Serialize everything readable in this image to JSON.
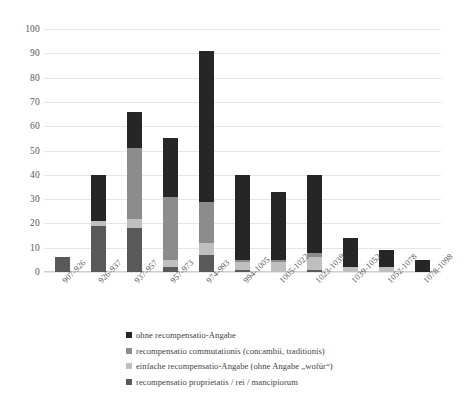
{
  "chart_data": {
    "type": "bar",
    "subtype": "stacked-column",
    "title": "",
    "xlabel": "",
    "ylabel": "",
    "ylim": [
      0,
      100
    ],
    "yticks": [
      0,
      10,
      20,
      30,
      40,
      50,
      60,
      70,
      80,
      90,
      100
    ],
    "grid": true,
    "legend_position": "bottom",
    "categories": [
      "907-926",
      "926-937",
      "937-957",
      "957-973",
      "974-993",
      "994-1005",
      "1005-1022",
      "1023-1039",
      "1039-1052",
      "1052-1078",
      "1078-1098"
    ],
    "series": [
      {
        "name": "recompensatio proprietatis / rei / mancipiorum",
        "color": "#595959",
        "values": [
          6,
          19,
          18,
          2,
          7,
          1,
          0,
          1,
          0,
          0,
          0
        ]
      },
      {
        "name": "einfache recompensatio-Angabe (ohne Angabe „wofür“)",
        "color": "#bfbfbf",
        "values": [
          0,
          2,
          4,
          3,
          5,
          3,
          4,
          5,
          2,
          2,
          0
        ]
      },
      {
        "name": "recompensatio commutationis (concambii, traditionis)",
        "color": "#8c8c8c",
        "values": [
          0,
          0,
          29,
          26,
          17,
          1,
          1,
          2,
          0,
          0,
          0
        ]
      },
      {
        "name": "ohne recompensatio-Angabe",
        "color": "#262626",
        "values": [
          0,
          19,
          15,
          24,
          62,
          35,
          28,
          32,
          12,
          7,
          5
        ]
      }
    ],
    "totals": [
      6,
      40,
      66,
      55,
      91,
      40,
      33,
      40,
      14,
      9,
      5
    ]
  },
  "legend": {
    "items": [
      {
        "label": "ohne recompensatio-Angabe",
        "color": "#262626"
      },
      {
        "label": "recompensatio commutationis (concambii, traditionis)",
        "color": "#8c8c8c"
      },
      {
        "label": "einfache recompensatio-Angabe (ohne Angabe „wofür“)",
        "color": "#bfbfbf"
      },
      {
        "label": "recompensatio proprietatis / rei / mancipiorum",
        "color": "#595959"
      }
    ]
  }
}
